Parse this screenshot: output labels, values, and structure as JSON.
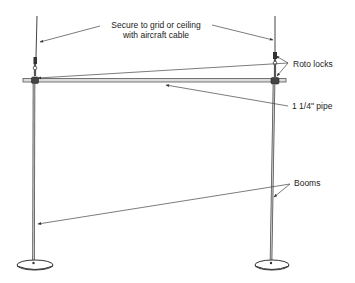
{
  "diagram": {
    "type": "technical-illustration",
    "colors": {
      "ink": "#333333",
      "background": "#ffffff"
    },
    "labels": {
      "cable_line1": "Secure to grid or ceiling",
      "cable_line2": "with aircraft cable",
      "roto_locks": "Roto locks",
      "pipe": "1 1/4\" pipe",
      "booms": "Booms"
    },
    "components": [
      {
        "name": "aircraft-cable",
        "count": 2
      },
      {
        "name": "roto-lock",
        "count": 2
      },
      {
        "name": "horizontal-pipe",
        "size": "1 1/4\"",
        "count": 1
      },
      {
        "name": "boom",
        "count": 2
      },
      {
        "name": "base",
        "count": 2
      }
    ]
  }
}
